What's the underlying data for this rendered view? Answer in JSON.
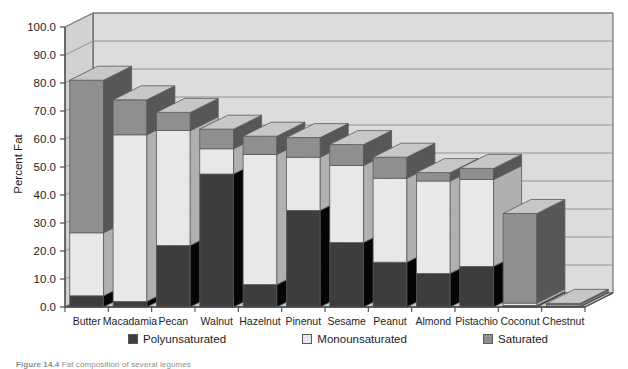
{
  "chart_data": {
    "type": "bar",
    "stacked": true,
    "projection": "3d",
    "title": "",
    "xlabel": "",
    "ylabel": "Percent Fat",
    "ylim": [
      0,
      100
    ],
    "ytick_step": 10,
    "grid": true,
    "legend_position": "bottom",
    "categories": [
      "Butter",
      "Macadamia",
      "Pecan",
      "Walnut",
      "Hazelnut",
      "Pinenut",
      "Sesame",
      "Peanut",
      "Almond",
      "Pistachio",
      "Coconut",
      "Chestnut"
    ],
    "ytick_labels": [
      "0.0",
      "10.0",
      "20.0",
      "30.0",
      "40.0",
      "50.0",
      "60.0",
      "70.0",
      "80.0",
      "90.0",
      "100.0"
    ],
    "ytick_values": [
      0,
      10,
      20,
      30,
      40,
      50,
      60,
      70,
      80,
      90,
      100
    ],
    "series": [
      {
        "name": "Polyunsaturated",
        "color": "#3d3d3d",
        "values": [
          4.0,
          2.0,
          22.0,
          47.5,
          8.0,
          34.5,
          23.0,
          16.0,
          12.0,
          14.5,
          0.5,
          0.4
        ]
      },
      {
        "name": "Monounsaturated",
        "color": "#e8e8e8",
        "values": [
          22.5,
          59.5,
          41.0,
          9.0,
          46.5,
          19.0,
          27.5,
          30.0,
          33.0,
          31.0,
          0.9,
          0.5
        ]
      },
      {
        "name": "Saturated",
        "color": "#8f8f8f",
        "values": [
          54.5,
          12.5,
          6.5,
          7.0,
          6.5,
          7.0,
          7.5,
          7.5,
          3.0,
          4.0,
          32.0,
          0.4
        ]
      }
    ],
    "totals": [
      81.0,
      74.0,
      69.5,
      63.5,
      61.0,
      60.5,
      58.0,
      53.5,
      48.0,
      49.5,
      33.4,
      1.3
    ]
  },
  "legend": {
    "items": [
      {
        "label": "Polyunsaturated",
        "color": "#3d3d3d"
      },
      {
        "label": "Monounsaturated",
        "color": "#e8e8e8"
      },
      {
        "label": "Saturated",
        "color": "#8f8f8f"
      }
    ]
  },
  "caption": {
    "prefix": "Figure 14.4",
    "text": "Fat composition of several legumes"
  },
  "style": {
    "plot_background": "#dcdcdc",
    "gridline_color": "#8a8a8a",
    "axis_color": "#4a4a4a",
    "bar_edge": "#5a5a5a"
  }
}
